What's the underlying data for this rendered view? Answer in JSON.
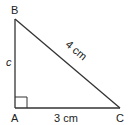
{
  "diagram": {
    "type": "right-triangle",
    "stroke_color": "#333333",
    "background": "#ffffff",
    "vertices": {
      "B": {
        "label": "B",
        "x": 15,
        "y": 19
      },
      "A": {
        "label": "A",
        "x": 15,
        "y": 108
      },
      "C": {
        "label": "C",
        "x": 120,
        "y": 108
      }
    },
    "right_angle_at": "A",
    "sides": {
      "AB": {
        "label": "c"
      },
      "AC": {
        "label": "3 cm"
      },
      "BC": {
        "label": "4 cm"
      }
    }
  }
}
